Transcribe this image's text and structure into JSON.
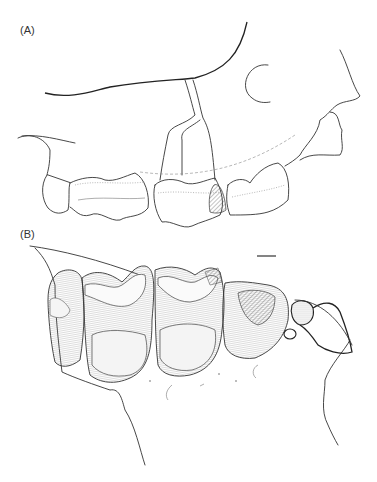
{
  "figure": {
    "panels": [
      {
        "id": "A",
        "label": "(A)",
        "view": "lateral view of upper dentition and maxilla"
      },
      {
        "id": "B",
        "label": "(B)",
        "view": "occlusal view of upper tooth row"
      }
    ],
    "scale_bar": {
      "present": true
    },
    "colors": {
      "line": "#333333",
      "background": "#ffffff",
      "hatch": "#555555"
    }
  }
}
